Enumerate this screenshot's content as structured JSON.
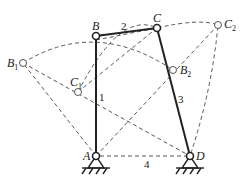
{
  "diagram": {
    "points": {
      "A": {
        "label": "A",
        "x": 96,
        "y": 156
      },
      "B": {
        "label": "B",
        "x": 96,
        "y": 36
      },
      "C": {
        "label": "C",
        "x": 157,
        "y": 28
      },
      "D": {
        "label": "D",
        "x": 190,
        "y": 156
      },
      "B1": {
        "label": "B",
        "sub": "1",
        "x": 23,
        "y": 63
      },
      "C1": {
        "label": "C",
        "sub": "1",
        "x": 78,
        "y": 92
      },
      "B2": {
        "label": "B",
        "sub": "2",
        "x": 173,
        "y": 70
      },
      "C2": {
        "label": "C",
        "sub": "2",
        "x": 218,
        "y": 25
      }
    },
    "links": [
      {
        "id": "1",
        "label": "1",
        "from": "A",
        "to": "B",
        "style": "solid"
      },
      {
        "id": "2",
        "label": "2",
        "from": "B",
        "to": "C",
        "style": "solid"
      },
      {
        "id": "3",
        "label": "3",
        "from": "C",
        "to": "D",
        "style": "solid"
      },
      {
        "id": "4",
        "label": "4",
        "from": "A",
        "to": "D",
        "style": "dashed"
      }
    ],
    "colors": {
      "line": "#222222",
      "dashed": "#444444",
      "background": "#ffffff"
    }
  }
}
